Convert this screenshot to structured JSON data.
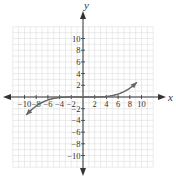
{
  "chart_data": {
    "type": "line",
    "title": "",
    "xlabel": "x",
    "ylabel": "y",
    "xlim": [
      -12,
      12
    ],
    "ylim": [
      -12,
      12
    ],
    "grid": true,
    "x_ticks": [
      -10,
      -8,
      -6,
      -4,
      -2,
      2,
      4,
      6,
      8,
      10
    ],
    "y_ticks": [
      10,
      8,
      6,
      4,
      2,
      -2,
      -4,
      -6,
      -8,
      -10
    ],
    "x_tick_labels": [
      "−10",
      "−8",
      "−6",
      "−4",
      "−2",
      "2",
      "4",
      "6",
      "8",
      "10"
    ],
    "y_tick_labels": [
      "10",
      "8",
      "6",
      "4",
      "2",
      "−2",
      "−4",
      "−6",
      "−8",
      "−10"
    ],
    "series": [
      {
        "name": "curve",
        "description": "cubic-like curve flat near the origin, arrows at both ends",
        "x": [
          -9.7,
          -8,
          -6,
          -4,
          -2,
          0,
          2,
          4,
          6,
          8,
          9.2
        ],
        "y": [
          -5,
          -2.2,
          -0.7,
          -0.15,
          0,
          0,
          0,
          0.3,
          1.3,
          3.2,
          5
        ],
        "arrows": "both",
        "color": "#666666"
      }
    ],
    "legend": null
  },
  "colors": {
    "axis": "#333333",
    "grid": "#d8d8d8",
    "curve": "#666666"
  }
}
